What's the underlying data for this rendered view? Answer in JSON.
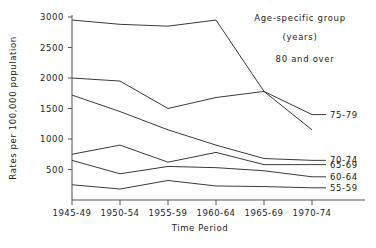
{
  "chart_data": {
    "type": "line",
    "title": "",
    "xlabel": "Time Period",
    "ylabel": "Rates per 100,000 population",
    "categories": [
      "1945-49",
      "1950-54",
      "1955-59",
      "1960-64",
      "1965-69",
      "1970-74"
    ],
    "ylim": [
      0,
      3000
    ],
    "yticks": [
      500,
      1000,
      1500,
      2000,
      2500,
      3000
    ],
    "ytick_labels": [
      "500",
      "1000",
      "1500",
      "2000",
      "2500",
      "3000"
    ],
    "grid": false,
    "legend_position": "top-right",
    "legend_title_line1": "Age-specific group",
    "legend_title_line2": "(years)",
    "legend_note": "80 and over",
    "series": [
      {
        "name": "80 and over",
        "label": "80 and over",
        "label_side": "legend",
        "values": [
          2950,
          2880,
          2850,
          2950,
          1780,
          1150
        ]
      },
      {
        "name": "75-79",
        "label": "75-79",
        "label_side": "right",
        "values": [
          2000,
          1950,
          1500,
          1680,
          1780,
          1400
        ]
      },
      {
        "name": "70-74",
        "label": "70-74",
        "label_side": "right",
        "values": [
          1720,
          1450,
          1150,
          900,
          680,
          650
        ]
      },
      {
        "name": "65-69",
        "label": "65-69",
        "label_side": "right",
        "values": [
          750,
          900,
          620,
          780,
          580,
          580
        ]
      },
      {
        "name": "60-64",
        "label": "60-64",
        "label_side": "right",
        "values": [
          650,
          430,
          550,
          530,
          480,
          380
        ]
      },
      {
        "name": "55-59",
        "label": "55-59",
        "label_side": "right",
        "values": [
          250,
          180,
          320,
          230,
          220,
          200
        ]
      }
    ],
    "colors": {
      "line": "#3a3a3a",
      "axis": "#555555",
      "text": "#222222",
      "background": "#ffffff"
    }
  },
  "axis": {
    "y_title": "Rates per 100,000 population",
    "x_title": "Time Period"
  },
  "legend": {
    "title_line1": "Age-specific group",
    "title_line2": "(years)",
    "top_series": "80 and over"
  }
}
